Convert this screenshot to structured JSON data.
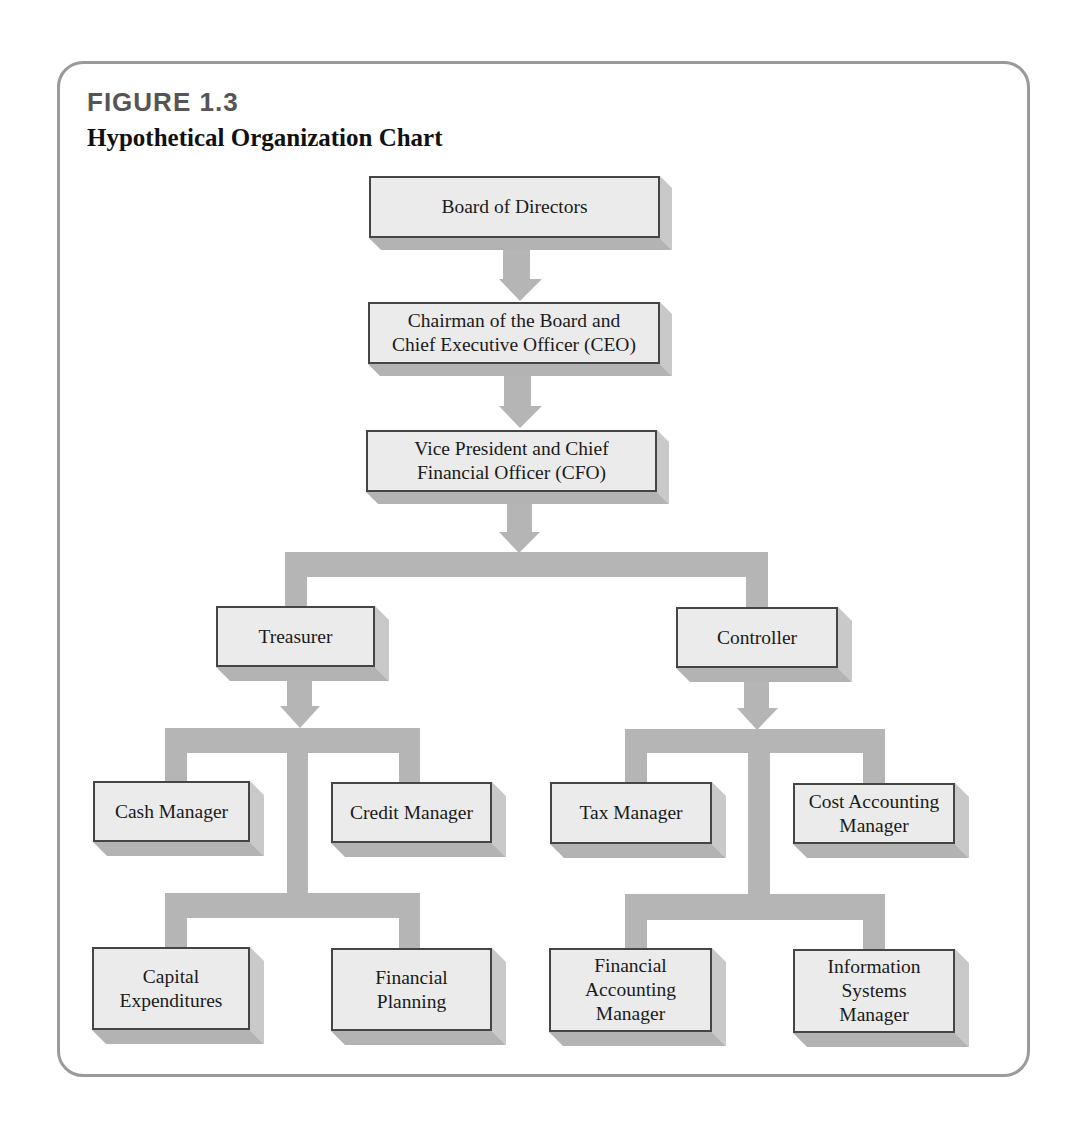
{
  "figure": {
    "number": "FIGURE 1.3",
    "title": "Hypothetical Organization Chart"
  },
  "colors": {
    "frame": "#9a9a9a",
    "box_fill": "#ebebeb",
    "box_border": "#454545",
    "connector": "#b5b5b5",
    "shadow_right": "#c9c9c9",
    "shadow_bottom": "#b3b3b3"
  },
  "nodes": {
    "board": {
      "label": "Board of Directors"
    },
    "ceo": {
      "label": "Chairman of the Board and\nChief Executive Officer (CEO)"
    },
    "cfo": {
      "label": "Vice President and Chief\nFinancial Officer (CFO)"
    },
    "treasurer": {
      "label": "Treasurer"
    },
    "controller": {
      "label": "Controller"
    },
    "cash_manager": {
      "label": "Cash Manager"
    },
    "credit_manager": {
      "label": "Credit Manager"
    },
    "capital_expenditures": {
      "label": "Capital\nExpenditures"
    },
    "financial_planning": {
      "label": "Financial\nPlanning"
    },
    "tax_manager": {
      "label": "Tax Manager"
    },
    "cost_accounting_manager": {
      "label": "Cost Accounting\nManager"
    },
    "financial_accounting_manager": {
      "label": "Financial\nAccounting\nManager"
    },
    "information_systems_manager": {
      "label": "Information\nSystems\nManager"
    }
  },
  "hierarchy": [
    {
      "parent": "Board of Directors",
      "children": [
        "Chairman of the Board and Chief Executive Officer (CEO)"
      ]
    },
    {
      "parent": "Chairman of the Board and Chief Executive Officer (CEO)",
      "children": [
        "Vice President and Chief Financial Officer (CFO)"
      ]
    },
    {
      "parent": "Vice President and Chief Financial Officer (CFO)",
      "children": [
        "Treasurer",
        "Controller"
      ]
    },
    {
      "parent": "Treasurer",
      "children": [
        "Cash Manager",
        "Credit Manager",
        "Capital Expenditures",
        "Financial Planning"
      ]
    },
    {
      "parent": "Controller",
      "children": [
        "Tax Manager",
        "Cost Accounting Manager",
        "Financial Accounting Manager",
        "Information Systems Manager"
      ]
    }
  ]
}
